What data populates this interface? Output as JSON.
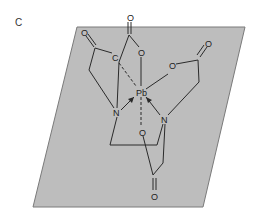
{
  "figure": {
    "panel_label": "C",
    "plane_color": "#bdbdbd",
    "line_color": "#2a2a2a"
  },
  "atoms": {
    "metal": "Pb",
    "n_left": "N",
    "n_right": "N",
    "o_top": "O",
    "o_top_carbonyl": "O",
    "o_right": "O",
    "o_right_carbonyl": "O",
    "o_left_carbonyl": "O",
    "o_left": "C",
    "o_bottom": "O",
    "o_bottom_carbonyl": "O"
  }
}
